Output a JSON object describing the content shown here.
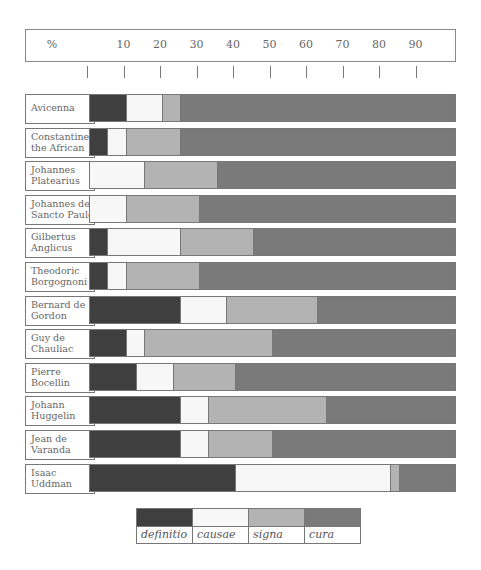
{
  "chart_data": {
    "type": "bar",
    "orientation": "horizontal",
    "stacked": true,
    "title": "",
    "xlabel": "%",
    "ylabel": "",
    "xlim": [
      0,
      100
    ],
    "x_ticks": [
      0,
      10,
      20,
      30,
      40,
      50,
      60,
      70,
      80,
      90
    ],
    "x_tick_labels": [
      "10",
      "20",
      "30",
      "40",
      "50",
      "60",
      "70",
      "80",
      "90"
    ],
    "axis_unit_label": "%",
    "grid": false,
    "legend_position": "bottom",
    "categories": [
      "Avicenna",
      "Constantine the African",
      "Johannes Platearius",
      "Johannes de Sancto Paulo",
      "Gilbertus Anglicus",
      "Theodoric Borgognoni",
      "Bernard de Gordon",
      "Guy de Chauliac",
      "Pierre Bocellin",
      "Johann Huggelin",
      "Jean de Varanda",
      "Isaac Uddman"
    ],
    "series": [
      {
        "name": "definitio",
        "color": "#3f3f3f",
        "values": [
          10,
          5,
          0,
          0,
          5,
          5,
          25,
          10,
          13,
          25,
          25,
          40
        ]
      },
      {
        "name": "causae",
        "color": "#f7f7f7",
        "values": [
          10,
          5,
          15,
          10,
          20,
          5,
          12.5,
          5,
          10,
          7.5,
          7.5,
          42.5
        ]
      },
      {
        "name": "signa",
        "color": "#b3b3b3",
        "values": [
          5,
          15,
          20,
          20,
          20,
          20,
          25,
          35,
          17,
          32.5,
          17.5,
          2.5
        ]
      },
      {
        "name": "cura",
        "color": "#7a7a7a",
        "values": [
          75,
          75,
          65,
          70,
          55,
          70,
          37.5,
          50,
          60,
          35,
          50,
          15
        ]
      }
    ]
  },
  "header": {
    "unit_label": "%",
    "tick_labels": [
      "10",
      "20",
      "30",
      "40",
      "50",
      "60",
      "70",
      "80",
      "90"
    ]
  },
  "rows": [
    {
      "line1": "Avicenna",
      "line2": ""
    },
    {
      "line1": "Constantine",
      "line2": "the African"
    },
    {
      "line1": "Johannes",
      "line2": "Platearius"
    },
    {
      "line1": "Johannes de",
      "line2": "Sancto Paulo"
    },
    {
      "line1": "Gilbertus",
      "line2": "Anglicus"
    },
    {
      "line1": "Theodoric",
      "line2": "Borgognoni"
    },
    {
      "line1": "Bernard de",
      "line2": "Gordon"
    },
    {
      "line1": "Guy de",
      "line2": "Chauliac"
    },
    {
      "line1": "Pierre",
      "line2": "Bocellin"
    },
    {
      "line1": "Johann",
      "line2": "Huggelin"
    },
    {
      "line1": "Jean de",
      "line2": "Varanda"
    },
    {
      "line1": "Isaac",
      "line2": "Uddman"
    }
  ],
  "legend": {
    "items": [
      {
        "label": "definitio",
        "color": "#3f3f3f"
      },
      {
        "label": "causae",
        "color": "#f7f7f7"
      },
      {
        "label": "signa",
        "color": "#b3b3b3"
      },
      {
        "label": "cura",
        "color": "#7a7a7a"
      }
    ]
  }
}
